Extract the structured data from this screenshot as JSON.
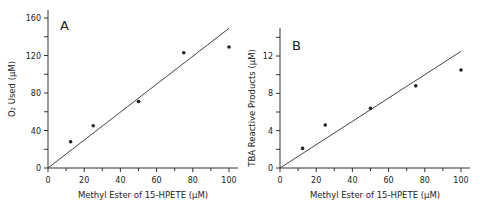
{
  "figure": {
    "panels": [
      "A",
      "B"
    ]
  },
  "chart_data": [
    {
      "type": "scatter",
      "panel_label": "A",
      "title": "",
      "xlabel": "Methyl Ester of 15-HPETE (μM)",
      "ylabel": "O₂ Used (μM)",
      "xlim": [
        0,
        105
      ],
      "ylim": [
        0,
        168
      ],
      "xticks": [
        0,
        20,
        40,
        60,
        80,
        100
      ],
      "yticks": [
        0,
        40,
        80,
        120,
        160
      ],
      "grid": false,
      "legend": null,
      "series": [
        {
          "name": "data",
          "x": [
            12.5,
            25,
            50,
            75,
            100
          ],
          "y": [
            28,
            45,
            71,
            123,
            129
          ]
        }
      ],
      "fit_line": {
        "x": [
          0,
          100
        ],
        "y": [
          0,
          149
        ]
      }
    },
    {
      "type": "scatter",
      "panel_label": "B",
      "title": "",
      "xlabel": "Methyl Ester of 15-HPETE (μM)",
      "ylabel": "TBA Reactive Products (μM)",
      "xlim": [
        0,
        105
      ],
      "ylim": [
        0,
        15
      ],
      "xticks": [
        0,
        20,
        40,
        60,
        80,
        100
      ],
      "yticks": [
        0,
        4,
        8,
        12
      ],
      "grid": false,
      "legend": null,
      "series": [
        {
          "name": "data",
          "x": [
            12.5,
            25,
            50,
            75,
            100
          ],
          "y": [
            2.1,
            4.6,
            6.4,
            8.8,
            10.5
          ]
        }
      ],
      "fit_line": {
        "x": [
          0,
          100
        ],
        "y": [
          0,
          12.5
        ]
      }
    }
  ]
}
